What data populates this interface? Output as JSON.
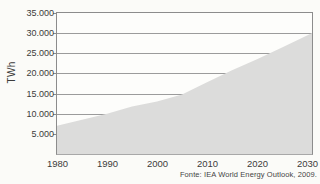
{
  "figure": {
    "ylabel": "TWh",
    "source_note": "Fonte: IEA World Energy Outlook, 2009."
  },
  "chart_data": {
    "type": "area",
    "title": "",
    "xlabel": "",
    "ylabel": "TWh",
    "x": [
      1980,
      1985,
      1990,
      1995,
      2000,
      2005,
      2010,
      2015,
      2020,
      2025,
      2030
    ],
    "values": [
      7000,
      8500,
      10000,
      11800,
      13000,
      14800,
      17800,
      20800,
      23500,
      26400,
      29400
    ],
    "xlim": [
      1980,
      2031
    ],
    "ylim": [
      0,
      35000
    ],
    "xtick_labels": [
      "1980",
      "1990",
      "2000",
      "2010",
      "2020",
      "2030"
    ],
    "ytick_values": [
      5000,
      10000,
      15000,
      20000,
      25000,
      30000,
      35000
    ],
    "ytick_labels": [
      "5.000",
      "10.000",
      "15.000",
      "20.000",
      "25.000",
      "30.000",
      "35.000"
    ],
    "grid": true,
    "legend": false,
    "source": "Fonte: IEA World Energy Outlook, 2009.",
    "colors": {
      "area_fill": "#dcdcdb",
      "grid": "#9b9b9b",
      "frame": "#8c8c8c",
      "text": "#3b3b3b",
      "background": "#fbfbf8"
    }
  }
}
